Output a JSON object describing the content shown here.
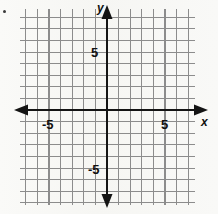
{
  "figure": {
    "kind": "cartesian-coordinate-grid",
    "background_color": "#f7f7f5",
    "grid_line_color": "#8c8c8c",
    "axis_color": "#141414",
    "text_color": "#101010"
  },
  "labels": {
    "x_axis": "x",
    "y_axis": "y",
    "x_pos_tick": "5",
    "x_neg_tick": "-5",
    "y_pos_tick": "5",
    "y_neg_tick": "-5"
  },
  "chart_data": {
    "type": "scatter",
    "title": "",
    "subtitle": "",
    "xlabel": "x",
    "ylabel": "y",
    "xlim": [
      -8,
      8
    ],
    "ylim": [
      -8,
      8
    ],
    "xticks": [
      -5,
      5
    ],
    "xticklabels": [
      "-5",
      "5"
    ],
    "yticks": [
      -5,
      5
    ],
    "yticklabels": [
      "-5",
      "5"
    ],
    "grid": true,
    "grid_step": 1,
    "minor_grid": false,
    "legend": null,
    "series": [],
    "x": [],
    "values": [],
    "annotations": [],
    "axis_arrows": [
      "left",
      "right",
      "up",
      "down"
    ],
    "origin_label": ""
  },
  "geometry": {
    "origin_x": 107,
    "origin_y": 110,
    "unit_px": 11.6,
    "grid_left": 20,
    "grid_right": 195,
    "grid_top": 9,
    "grid_bottom": 205,
    "v_lines_left_of_axis": 7,
    "v_lines_right_of_axis": 7,
    "h_lines_above_axis": 8,
    "h_lines_below_axis": 8
  }
}
